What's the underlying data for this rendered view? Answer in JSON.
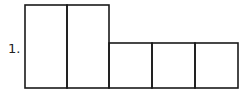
{
  "problem": {
    "number_label": "1."
  },
  "diagram": {
    "stroke_color": "#1a1a1a",
    "tall_boxes": [
      {
        "x": 25,
        "y": 5,
        "w": 42,
        "h": 83
      },
      {
        "x": 67,
        "y": 5,
        "w": 42,
        "h": 83
      }
    ],
    "short_boxes": [
      {
        "x": 109,
        "y": 43,
        "w": 43,
        "h": 45
      },
      {
        "x": 152,
        "y": 43,
        "w": 43,
        "h": 45
      },
      {
        "x": 195,
        "y": 43,
        "w": 43,
        "h": 45
      }
    ]
  }
}
